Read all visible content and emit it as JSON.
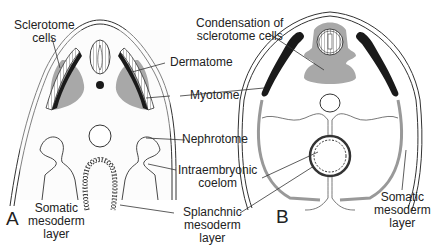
{
  "figure": {
    "panels": [
      {
        "id": "A",
        "label": "A"
      },
      {
        "id": "B",
        "label": "B"
      }
    ],
    "labels": {
      "sclerotome_cells": [
        "Sclerotome",
        "cells"
      ],
      "condensation": [
        "Condensation of",
        "sclerotome cells"
      ],
      "dermatome": "Dermatome",
      "myotome": "Myotome",
      "nephrotome": "Nephrotome",
      "intraembryonic_coelom": [
        "Intraembryonic",
        "coelom"
      ],
      "splanchnic": [
        "Splanchnic",
        "mesoderm",
        "layer"
      ],
      "somatic_a": [
        "Somatic",
        "mesoderm",
        "layer"
      ],
      "somatic_b": [
        "Somatic",
        "mesoderm",
        "layer"
      ]
    },
    "colors": {
      "line": "#333333",
      "dark_tissue": "#1a1a1a",
      "gray_tissue": "#a8a8a8",
      "light_fill": "#f4f4f4"
    }
  }
}
